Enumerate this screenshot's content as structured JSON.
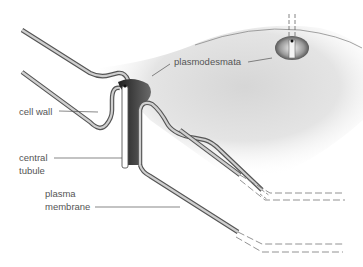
{
  "diagram": {
    "labels": {
      "plasmodesmata": "plasmodesmata",
      "cell_wall": "cell wall",
      "central_tubule_line1": "central",
      "central_tubule_line2": "tubule",
      "plasma_membrane_line1": "plasma",
      "plasma_membrane_line2": "membrane"
    },
    "colors": {
      "line": "#555555",
      "wall_fill": "#c8c8c8",
      "shading": "#bdbdbd",
      "dark_channel": "#2e2e2e",
      "background": "#ffffff"
    }
  }
}
